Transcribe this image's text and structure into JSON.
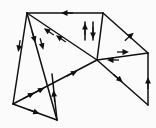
{
  "figure": {
    "background_color": "#fbfbfb",
    "line_color": "#101010",
    "width": 156,
    "height": 128
  },
  "vertices": [
    {
      "id": "v-top-left",
      "label": "top-left apex",
      "x": 27,
      "y": 13
    },
    {
      "id": "v-top-right",
      "label": "top-right apex",
      "x": 103,
      "y": 13
    },
    {
      "id": "v-hub",
      "label": "central hub",
      "x": 97,
      "y": 60
    },
    {
      "id": "v-right",
      "label": "right vertex",
      "x": 148,
      "y": 53
    },
    {
      "id": "v-bottom-right",
      "label": "bottom-right foot",
      "x": 148,
      "y": 105
    },
    {
      "id": "v-bottom-left",
      "label": "bottom-left foot",
      "x": 13,
      "y": 104
    },
    {
      "id": "v-bottom-mid",
      "label": "bottom-middle foot",
      "x": 57,
      "y": 120
    },
    {
      "id": "v-cross",
      "label": "crossing point",
      "x": 52,
      "y": 76
    }
  ],
  "edges": [
    {
      "id": "edge-top",
      "label": "top ridge",
      "from": "v-top-right",
      "to": "v-top-left",
      "x1": 103,
      "y1": 13,
      "x2": 27,
      "y2": 13,
      "arrows": 1,
      "direction": "left"
    },
    {
      "id": "edge-topleft-hub",
      "label": "top-left to hub diagonal",
      "from": "v-hub",
      "to": "v-top-left",
      "x1": 97,
      "y1": 60,
      "x2": 27,
      "y2": 13,
      "arrows": 2,
      "direction": "up-left"
    },
    {
      "id": "edge-topleft-botleft",
      "label": "left outer edge",
      "from": "v-top-left",
      "to": "v-bottom-left",
      "x1": 27,
      "y1": 13,
      "x2": 13,
      "y2": 104,
      "arrows": 1,
      "direction": "down"
    },
    {
      "id": "edge-topleft-botmid",
      "label": "left inner edge",
      "from": "v-top-left",
      "to": "v-bottom-mid",
      "x1": 27,
      "y1": 13,
      "x2": 57,
      "y2": 120,
      "arrows": 2,
      "direction": "down"
    },
    {
      "id": "edge-topright-hub-a",
      "label": "short vertical up arrow",
      "from": "v-hub",
      "to": "v-top-right",
      "x1": 85,
      "y1": 40,
      "x2": 85,
      "y2": 22,
      "arrows": 1,
      "direction": "up"
    },
    {
      "id": "edge-topright-hub-b",
      "label": "short vertical down arrow",
      "from": "v-top-right",
      "to": "v-hub",
      "x1": 93,
      "y1": 22,
      "x2": 93,
      "y2": 40,
      "arrows": 1,
      "direction": "down"
    },
    {
      "id": "edge-topright-verti",
      "label": "top-right to hub vertical",
      "from": "v-top-right",
      "to": "v-hub",
      "x1": 103,
      "y1": 13,
      "x2": 97,
      "y2": 60,
      "arrows": 0,
      "direction": "none"
    },
    {
      "id": "edge-topright-right",
      "label": "upper right slope",
      "from": "v-right",
      "to": "v-top-right",
      "x1": 148,
      "y1": 53,
      "x2": 103,
      "y2": 13,
      "arrows": 1,
      "direction": "up-right"
    },
    {
      "id": "edge-hub-right",
      "label": "hub to right vertex",
      "from": "v-hub",
      "to": "v-right",
      "x1": 97,
      "y1": 60,
      "x2": 148,
      "y2": 53,
      "arrows": 2,
      "direction": "both"
    },
    {
      "id": "edge-hub-botright",
      "label": "hub to bottom-right",
      "from": "v-hub",
      "to": "v-bottom-right",
      "x1": 97,
      "y1": 60,
      "x2": 148,
      "y2": 105,
      "arrows": 1,
      "direction": "down-right"
    },
    {
      "id": "edge-right-botright",
      "label": "right vertical edge",
      "from": "v-bottom-right",
      "to": "v-right",
      "x1": 148,
      "y1": 105,
      "x2": 148,
      "y2": 53,
      "arrows": 1,
      "direction": "up"
    },
    {
      "id": "edge-botleft-hub",
      "label": "long lower diagonal",
      "from": "v-bottom-left",
      "to": "v-hub",
      "x1": 13,
      "y1": 104,
      "x2": 97,
      "y2": 60,
      "arrows": 3,
      "direction": "up-right"
    },
    {
      "id": "edge-botleft-botmid",
      "label": "bottom edge",
      "from": "v-bottom-left",
      "to": "v-bottom-mid",
      "x1": 13,
      "y1": 104,
      "x2": 57,
      "y2": 120,
      "arrows": 1,
      "direction": "right"
    },
    {
      "id": "edge-botmid-cross",
      "label": "bottom-mid rising edge",
      "from": "v-bottom-mid",
      "to": "v-cross",
      "x1": 57,
      "y1": 120,
      "x2": 52,
      "y2": 74,
      "arrows": 1,
      "direction": "up"
    }
  ],
  "arrow_markers": [
    {
      "id": "arrow-top-ridge",
      "label": "left arrow on top ridge",
      "x": 66,
      "y": 13,
      "angle": 180
    },
    {
      "id": "arrow-diag-a",
      "label": "up-left arrow on hub diagonal",
      "x": 60,
      "y": 38,
      "angle": 214
    },
    {
      "id": "arrow-diag-b",
      "label": "second up-left arrow on diagonal",
      "x": 48,
      "y": 31,
      "angle": 214
    },
    {
      "id": "arrow-left-outer",
      "label": "down arrow on left outer edge",
      "x": 19,
      "y": 47,
      "angle": 99
    },
    {
      "id": "arrow-left-inner-a",
      "label": "down arrow on left inner edge",
      "x": 34,
      "y": 38,
      "angle": 74
    },
    {
      "id": "arrow-left-inner-b",
      "label": "second down arrow inner edge",
      "x": 42,
      "y": 45,
      "angle": 74
    },
    {
      "id": "arrow-vert-up",
      "label": "short up arrow",
      "x": 85,
      "y": 28,
      "angle": 270
    },
    {
      "id": "arrow-vert-down",
      "label": "short down arrow",
      "x": 93,
      "y": 34,
      "angle": 90
    },
    {
      "id": "arrow-right-slope",
      "label": "up-right arrow on right slope",
      "x": 130,
      "y": 36,
      "angle": 318
    },
    {
      "id": "arrow-hub-right-fwd",
      "label": "right arrow hub to right",
      "x": 124,
      "y": 52,
      "angle": 0
    },
    {
      "id": "arrow-hub-right-back",
      "label": "left arrow right to hub",
      "x": 112,
      "y": 60,
      "angle": 180
    },
    {
      "id": "arrow-hub-botright",
      "label": "down-right arrow to bottom-right",
      "x": 119,
      "y": 79,
      "angle": 41
    },
    {
      "id": "arrow-right-vertical",
      "label": "up arrow on right vertical",
      "x": 148,
      "y": 82,
      "angle": 270
    },
    {
      "id": "arrow-lower-diag-a",
      "label": "up-right arrow lower diagonal",
      "x": 30,
      "y": 95,
      "angle": 332
    },
    {
      "id": "arrow-lower-diag-b",
      "label": "second arrow lower diagonal",
      "x": 40,
      "y": 90,
      "angle": 332
    },
    {
      "id": "arrow-lower-diag-c",
      "label": "third arrow lower diagonal",
      "x": 73,
      "y": 73,
      "angle": 332
    },
    {
      "id": "arrow-bottom-edge",
      "label": "right arrow on bottom edge",
      "x": 35,
      "y": 112,
      "angle": 20
    },
    {
      "id": "arrow-botmid-rising",
      "label": "up arrow on rising edge",
      "x": 54,
      "y": 95,
      "angle": 264
    }
  ]
}
